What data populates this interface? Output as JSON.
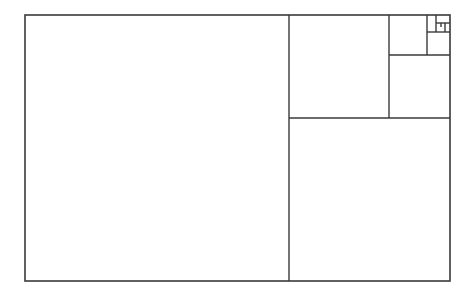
{
  "diagram": {
    "type": "golden-rectangle-subdivision",
    "stroke_color": "#3a3a3a",
    "background": "#ffffff",
    "outer": {
      "x": 25,
      "y": 15,
      "w": 425,
      "h": 266
    },
    "lines": [
      {
        "id": "v1",
        "x1": 289,
        "y1": 15,
        "x2": 289,
        "y2": 281
      },
      {
        "id": "h1",
        "x1": 289,
        "y1": 118,
        "x2": 450,
        "y2": 118
      },
      {
        "id": "v2",
        "x1": 389,
        "y1": 15,
        "x2": 389,
        "y2": 118
      },
      {
        "id": "h2",
        "x1": 389,
        "y1": 55,
        "x2": 450,
        "y2": 55
      },
      {
        "id": "v3",
        "x1": 427,
        "y1": 15,
        "x2": 427,
        "y2": 55
      },
      {
        "id": "h3",
        "x1": 427,
        "y1": 32,
        "x2": 450,
        "y2": 32
      },
      {
        "id": "v4",
        "x1": 436,
        "y1": 15,
        "x2": 436,
        "y2": 32
      },
      {
        "id": "h4",
        "x1": 436,
        "y1": 23,
        "x2": 450,
        "y2": 23
      },
      {
        "id": "v5",
        "x1": 445,
        "y1": 23,
        "x2": 445,
        "y2": 32
      },
      {
        "id": "h5",
        "x1": 441,
        "y1": 23,
        "x2": 441,
        "y2": 27
      }
    ]
  }
}
